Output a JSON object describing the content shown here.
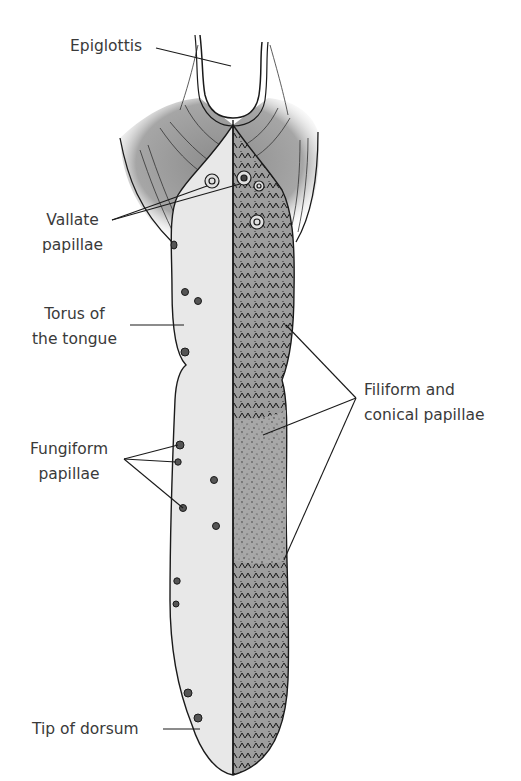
{
  "colors": {
    "background": "#ffffff",
    "outline": "#1a1a1a",
    "smooth_half": "#e9e9e9",
    "textured_half": "#a8a8a8",
    "muscle_shading": "#9a9a9a",
    "label_text": "#3a3a3a"
  },
  "labels": {
    "epiglottis": {
      "line1": "Epiglottis"
    },
    "vallate": {
      "line1": "Vallate",
      "line2": "papillae"
    },
    "torus": {
      "line1": "Torus of",
      "line2": "the tongue"
    },
    "fungiform": {
      "line1": "Fungiform",
      "line2": "papillae"
    },
    "filiform": {
      "line1": "Filiform and",
      "line2": "conical papillae"
    },
    "tip": {
      "line1": "Tip of dorsum"
    }
  }
}
